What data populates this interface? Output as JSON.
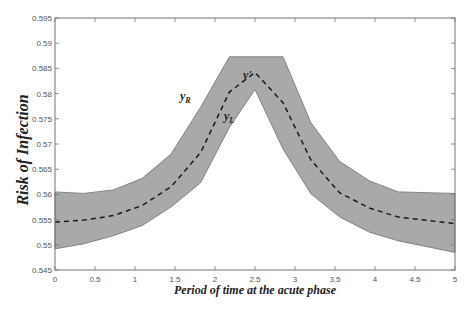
{
  "chart_data": {
    "type": "area",
    "title": "",
    "xlabel": "Period of time at the acute phase",
    "ylabel": "Risk of Infection",
    "xlim": [
      0,
      5
    ],
    "ylim": [
      0.545,
      0.595
    ],
    "xticks": [
      "0",
      "0.5",
      "1",
      "1.5",
      "2",
      "2.5",
      "3",
      "3.5",
      "4",
      "4.5",
      "5"
    ],
    "yticks": [
      "0.545",
      "0.55",
      "0.555",
      "0.56",
      "0.565",
      "0.57",
      "0.575",
      "0.58",
      "0.585",
      "0.59",
      "0.595"
    ],
    "grid": false,
    "legend": null,
    "x": [
      0,
      0.36,
      0.73,
      1.09,
      1.45,
      1.82,
      2.18,
      2.5,
      2.85,
      3.2,
      3.56,
      3.93,
      4.29,
      5
    ],
    "series": [
      {
        "name": "y_R (upper bound)",
        "values": [
          0.5605,
          0.5602,
          0.5609,
          0.5632,
          0.568,
          0.5773,
          0.5873,
          0.5873,
          0.5873,
          0.5742,
          0.5665,
          0.5627,
          0.5605,
          0.5602
        ]
      },
      {
        "name": "y_L (lower bound)",
        "values": [
          0.5492,
          0.5502,
          0.5518,
          0.5538,
          0.5575,
          0.5623,
          0.5733,
          0.5808,
          0.569,
          0.5601,
          0.5555,
          0.5525,
          0.5508,
          0.5485
        ]
      },
      {
        "name": "y' (mean, dashed)",
        "values": [
          0.5545,
          0.5549,
          0.5558,
          0.5578,
          0.5615,
          0.5683,
          0.5803,
          0.5842,
          0.5782,
          0.5668,
          0.5603,
          0.5573,
          0.5555,
          0.5542
        ]
      }
    ],
    "annotations": [
      {
        "text": "y'",
        "x": 2.35,
        "y": 0.5825
      },
      {
        "text": "y_R",
        "x": 1.55,
        "y": 0.5725
      },
      {
        "text": "y_L",
        "x": 2.15,
        "y": 0.5665
      }
    ],
    "colors": {
      "band_fill": "#a9a9a9",
      "band_edge": "#707070",
      "mean_line": "#1a1a1a",
      "axis": "#777777"
    }
  },
  "labels": {
    "xlabel": "Period of time at the acute phase",
    "ylabel": "Risk of Infection",
    "annot_mean": "y",
    "annot_mean_prime": "'",
    "annot_upper": "y",
    "annot_upper_sub": "R",
    "annot_lower": "y",
    "annot_lower_sub": "L"
  }
}
